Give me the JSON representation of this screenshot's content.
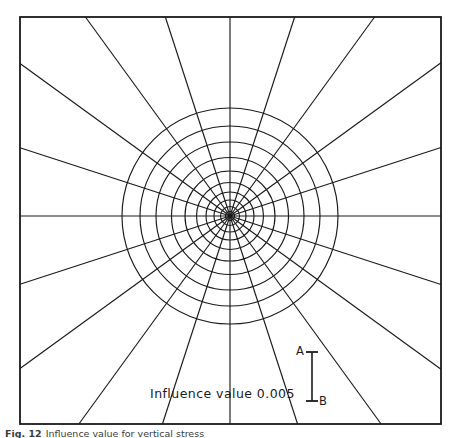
{
  "figure": {
    "domain": "newmark-influence-chart",
    "caption_label": "Fig. 12",
    "caption_text": "Influence value for vertical stress",
    "influence_label": "Influence value 0.005",
    "scale_top_letter": "A",
    "scale_bottom_letter": "B",
    "line_color": "#1a1a1a",
    "background_color": "#ffffff",
    "frame": {
      "left": 20,
      "top": 17,
      "right": 441,
      "bottom": 424,
      "stroke_width": 1.8
    }
  },
  "chart_data": {
    "type": "diagram",
    "influence_value": 0.005,
    "center": {
      "x": 230,
      "y": 216
    },
    "n_radial_spokes": 20,
    "spoke_angle_step_deg": 18,
    "spoke_angles_deg": [
      0,
      18,
      36,
      54,
      72,
      90,
      108,
      126,
      144,
      162,
      180,
      198,
      216,
      234,
      252,
      270,
      288,
      306,
      324,
      342
    ],
    "n_concentric_circles": 10,
    "circle_radii_px": [
      4.5,
      9.5,
      16,
      24,
      33.5,
      45,
      58.5,
      74,
      90,
      108
    ],
    "n_influence_blocks": 200,
    "scale_bar": {
      "x_px": 312,
      "top_y_px": 352,
      "bottom_y_px": 401,
      "cap_half_width_px": 6,
      "top_label": "A",
      "bottom_label": "B"
    }
  }
}
